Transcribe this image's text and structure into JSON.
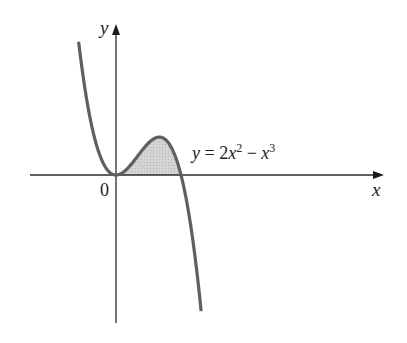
{
  "figure": {
    "y_axis_label": "y",
    "x_axis_label": "x",
    "origin_label": "0",
    "equation": {
      "lhs": "y",
      "eq": " = 2",
      "var1": "x",
      "exp1": "2",
      "minus": " − ",
      "var2": "x",
      "exp2": "3",
      "full_text": "y = 2x^2 − x^3"
    },
    "colors": {
      "curve": "#5f5f5f",
      "axes": "#2a2a2a",
      "shading": "#c8c8c8"
    },
    "shaded_region": "Area between curve and x-axis for 0 ≤ x ≤ 2"
  },
  "chart_data": {
    "type": "line",
    "title": "",
    "function": "y = 2x^2 - x^3",
    "xlabel": "x",
    "ylabel": "y",
    "x_range": [
      -1.15,
      2.62
    ],
    "roots": [
      0,
      2
    ],
    "local_min": {
      "x": 0,
      "y": 0
    },
    "local_max": {
      "x": 1.333,
      "y": 1.185
    },
    "shaded_interval": [
      0,
      2
    ],
    "grid": false,
    "legend": null,
    "annotations": [
      "0",
      "y = 2x^2 − x^3"
    ]
  }
}
